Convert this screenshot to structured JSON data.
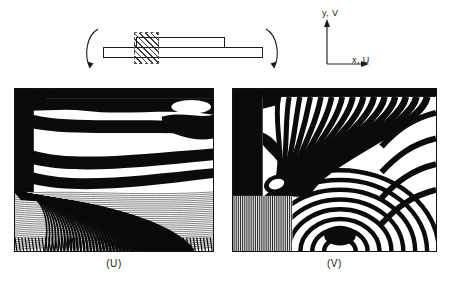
{
  "figure": {
    "type": "moire-interferometry-fringe-patterns",
    "schematic": {
      "name": "bent-laminate-specimen",
      "lower_plate": "plate",
      "upper_plate": "plate",
      "hatched_region": "field-of-view",
      "left_moment_arrow": "curved-arrow-ccw",
      "right_moment_arrow": "curved-arrow-cw"
    },
    "axes": {
      "y_label": "y, V",
      "x_label": "x, U"
    },
    "panels": [
      {
        "id": "U",
        "caption": "(U)",
        "description": "horizontal displacement field fringe pattern",
        "features": "broad curved fringes above, dense packed fringes below"
      },
      {
        "id": "V",
        "caption": "(V)",
        "description": "vertical displacement field fringe pattern",
        "features": "near-vertical fringes with closed loop at left and concentric arcs lower right"
      }
    ],
    "colors": {
      "fringe_dark": "#0b0b0b",
      "fringe_light": "#ffffff",
      "line": "#1a1a1a",
      "background": "#ffffff"
    }
  }
}
